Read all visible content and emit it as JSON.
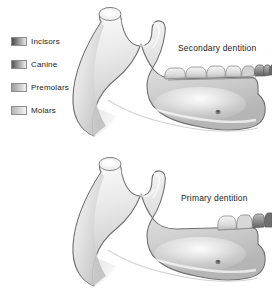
{
  "figure": {
    "background_color": "#ffffff",
    "text_color": "#232323"
  },
  "legend": {
    "name": "tooth-type-legend",
    "items": [
      {
        "label": "Incisors",
        "swatch_from": "#4a4a4a",
        "swatch_to": "#e9e9e9",
        "key": "incisors"
      },
      {
        "label": "Canine",
        "swatch_from": "#555555",
        "swatch_to": "#ededed",
        "key": "canine"
      },
      {
        "label": "Premolars",
        "swatch_from": "#9c9c9c",
        "swatch_to": "#f2f2f2",
        "key": "premolars"
      },
      {
        "label": "Molars",
        "swatch_from": "#b4b4b4",
        "swatch_to": "#f6f6f6",
        "key": "molars"
      }
    ]
  },
  "diagrams": [
    {
      "key": "secondary",
      "caption": "Secondary dentition",
      "tooth_count": 8,
      "description": "Adult mandible, lateral view, full permanent tooth row"
    },
    {
      "key": "primary",
      "caption": "Primary dentition",
      "tooth_count": 4,
      "description": "Child mandible, lateral view, deciduous tooth row"
    }
  ],
  "bone": {
    "fill_light": "#fbfbfb",
    "fill_mid": "#d6d6d6",
    "fill_shadow": "#a8a8a8",
    "outline": "#6f6f6f"
  },
  "teeth": {
    "secondary_shades": [
      "#e7e7e7",
      "#e2e2e2",
      "#dedede",
      "#d9d9d9",
      "#cfcfcf",
      "#b9b9b9",
      "#8f8f8f",
      "#6f6f6f"
    ],
    "primary_shades": [
      "#e0e0e0",
      "#d4d4d4",
      "#a9a9a9",
      "#7d7d7d"
    ]
  },
  "landmarks": {
    "mental_foramen": "mental-foramen"
  }
}
